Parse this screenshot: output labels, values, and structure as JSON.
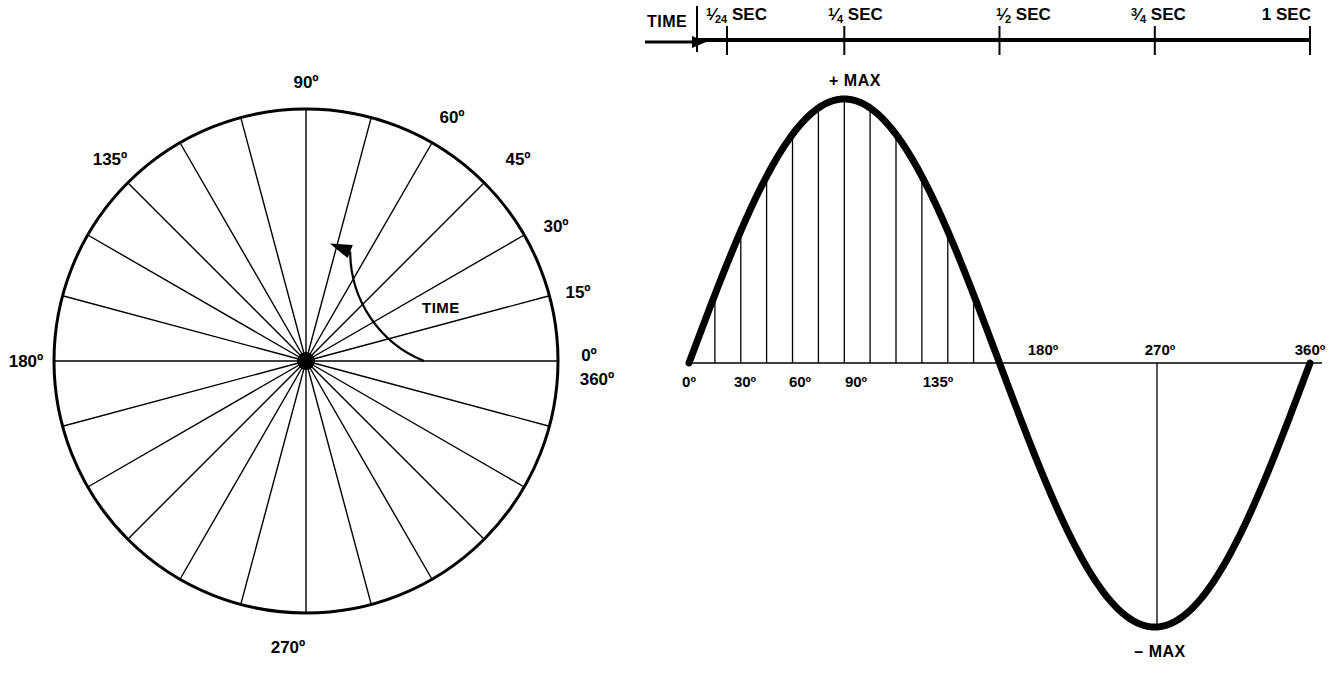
{
  "figure": {
    "stroke_color": "#000000",
    "background": "#ffffff"
  },
  "circle_diagram": {
    "name": "rotating-vector-circle",
    "center": {
      "x": 306,
      "y": 361
    },
    "radius": 252,
    "spoke_step_degrees": 15,
    "spoke_count": 24,
    "rotation_arc": {
      "label": "TIME",
      "start_degrees": 0,
      "end_degrees": 68,
      "arc_radius": 118,
      "arrow": "counterclockwise"
    },
    "labels": [
      {
        "text": "90º",
        "degrees": 90
      },
      {
        "text": "60º",
        "degrees": 60
      },
      {
        "text": "45º",
        "degrees": 45
      },
      {
        "text": "30º",
        "degrees": 30
      },
      {
        "text": "15º",
        "degrees": 15
      },
      {
        "text": "0º",
        "degrees": 0
      },
      {
        "text": "360º",
        "degrees": 0
      },
      {
        "text": "135º",
        "degrees": 135
      },
      {
        "text": "180º",
        "degrees": 180
      },
      {
        "text": "270º",
        "degrees": 270
      }
    ]
  },
  "time_axis": {
    "name": "time-axis",
    "label": "TIME",
    "arrow": "right",
    "ticks": [
      {
        "value": "1/24",
        "unit": "SEC",
        "display_whole": "",
        "display_num": "1",
        "display_den": "24",
        "x_deg": 15
      },
      {
        "value": "1/4",
        "unit": "SEC",
        "display_whole": "",
        "display_num": "1",
        "display_den": "4",
        "x_deg": 90
      },
      {
        "value": "1/2",
        "unit": "SEC",
        "display_whole": "",
        "display_num": "1",
        "display_den": "2",
        "x_deg": 180
      },
      {
        "value": "3/4",
        "unit": "SEC",
        "display_whole": "",
        "display_num": "3",
        "display_den": "4",
        "x_deg": 270
      },
      {
        "value": "1",
        "unit": "SEC",
        "display_whole": "1",
        "display_num": "",
        "display_den": "",
        "x_deg": 360
      }
    ]
  },
  "sine_plot": {
    "name": "sine-wave-plot",
    "peak_label": "+ MAX",
    "trough_label": "– MAX",
    "x_tick_labels": [
      "0º",
      "30º",
      "60º",
      "90º",
      "135º",
      "180º",
      "270º",
      "360º"
    ],
    "x_tick_degrees": [
      0,
      30,
      60,
      90,
      135,
      180,
      270,
      360
    ],
    "ordinate_degrees": [
      15,
      30,
      45,
      60,
      75,
      90,
      105,
      120,
      135,
      150,
      165
    ],
    "has_270_ordinate": true
  },
  "chart_data": {
    "type": "line",
    "xlabel": "Degrees of rotation",
    "ylabel": "Instantaneous value",
    "xlim": [
      0,
      360
    ],
    "ylim": [
      -1,
      1
    ],
    "grid": false,
    "legend": null,
    "annotations": [
      "+ MAX",
      "– MAX",
      "TIME"
    ],
    "x": [
      0,
      15,
      30,
      45,
      60,
      75,
      90,
      105,
      120,
      135,
      150,
      165,
      180,
      195,
      210,
      225,
      240,
      255,
      270,
      285,
      300,
      315,
      330,
      345,
      360
    ],
    "series": [
      {
        "name": "sine",
        "values": [
          0,
          0.259,
          0.5,
          0.707,
          0.866,
          0.966,
          1,
          0.966,
          0.866,
          0.707,
          0.5,
          0.259,
          0,
          -0.259,
          -0.5,
          -0.707,
          -0.866,
          -0.966,
          -1,
          -0.966,
          -0.866,
          -0.707,
          -0.5,
          -0.259,
          0
        ]
      }
    ],
    "secondary_axis": {
      "name": "time",
      "label": "TIME",
      "tick_labels": [
        "1/24 SEC",
        "1/4 SEC",
        "1/2 SEC",
        "3/4 SEC",
        "1 SEC"
      ],
      "tick_x_degrees": [
        15,
        90,
        180,
        270,
        360
      ]
    }
  }
}
